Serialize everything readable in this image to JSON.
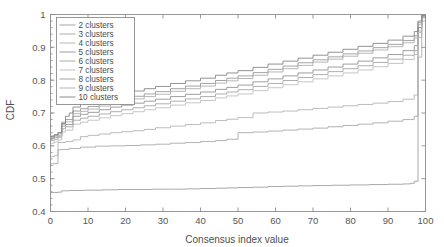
{
  "chart_data": {
    "type": "line",
    "title": "",
    "xlabel": "Consensus index value",
    "ylabel": "CDF",
    "xlim": [
      0,
      100
    ],
    "ylim": [
      0.4,
      1.0
    ],
    "grid": false,
    "legend_position": "upper-left",
    "xticks": [
      0,
      10,
      20,
      30,
      40,
      50,
      60,
      70,
      80,
      90,
      100
    ],
    "xtick_labels": [
      "0",
      "10",
      "20",
      "30",
      "40",
      "50",
      "60",
      "70",
      "80",
      "90",
      "100"
    ],
    "yticks": [
      0.4,
      0.5,
      0.6,
      0.7,
      0.8,
      0.9,
      1.0
    ],
    "ytick_labels": [
      "0.4",
      "0.5",
      "0.6",
      "0.7",
      "0.8",
      "0.9",
      "1"
    ],
    "series": [
      {
        "name": "2 clusters",
        "color": "#9a9a9a",
        "x": [
          0,
          1,
          2,
          3,
          5,
          9,
          14,
          18,
          22,
          27,
          32,
          36,
          40,
          44,
          47,
          50,
          54,
          58,
          62,
          66,
          70,
          75,
          80,
          85,
          90,
          94,
          96,
          97,
          98,
          99,
          100
        ],
        "y": [
          0.458,
          0.458,
          0.459,
          0.463,
          0.464,
          0.465,
          0.466,
          0.467,
          0.467,
          0.468,
          0.468,
          0.469,
          0.47,
          0.471,
          0.472,
          0.473,
          0.474,
          0.476,
          0.477,
          0.478,
          0.479,
          0.48,
          0.481,
          0.482,
          0.483,
          0.484,
          0.486,
          0.492,
          0.96,
          0.995,
          1.0
        ]
      },
      {
        "name": "3 clusters",
        "color": "#a5a5a5",
        "x": [
          0,
          1,
          2,
          3,
          5,
          8,
          12,
          16,
          20,
          24,
          28,
          32,
          36,
          40,
          44,
          47,
          50,
          54,
          58,
          62,
          66,
          70,
          74,
          78,
          82,
          86,
          90,
          94,
          97,
          98,
          99,
          100
        ],
        "y": [
          0.545,
          0.546,
          0.588,
          0.589,
          0.592,
          0.596,
          0.599,
          0.6,
          0.601,
          0.603,
          0.605,
          0.608,
          0.61,
          0.613,
          0.616,
          0.62,
          0.64,
          0.642,
          0.645,
          0.648,
          0.651,
          0.654,
          0.658,
          0.662,
          0.666,
          0.67,
          0.675,
          0.68,
          0.69,
          0.87,
          0.98,
          1.0
        ]
      },
      {
        "name": "4 clusters",
        "color": "#b0b0b0",
        "x": [
          0,
          1,
          2,
          4,
          6,
          8,
          10,
          13,
          16,
          19,
          22,
          25,
          28,
          32,
          36,
          40,
          44,
          47,
          50,
          54,
          58,
          62,
          66,
          70,
          74,
          78,
          82,
          86,
          90,
          94,
          97,
          98,
          99,
          100
        ],
        "y": [
          0.567,
          0.57,
          0.61,
          0.613,
          0.618,
          0.628,
          0.632,
          0.636,
          0.64,
          0.643,
          0.646,
          0.65,
          0.655,
          0.66,
          0.665,
          0.67,
          0.677,
          0.681,
          0.686,
          0.7,
          0.703,
          0.706,
          0.71,
          0.714,
          0.718,
          0.722,
          0.726,
          0.73,
          0.735,
          0.742,
          0.755,
          0.93,
          0.99,
          1.0
        ]
      },
      {
        "name": "5 clusters",
        "color": "#8e8e8e",
        "x": [
          0,
          1,
          2,
          3,
          4,
          6,
          8,
          10,
          13,
          16,
          19,
          22,
          25,
          28,
          32,
          36,
          40,
          44,
          47,
          50,
          54,
          58,
          62,
          66,
          70,
          74,
          78,
          82,
          86,
          90,
          94,
          97,
          98,
          99,
          100
        ],
        "y": [
          0.622,
          0.626,
          0.63,
          0.66,
          0.665,
          0.69,
          0.696,
          0.702,
          0.71,
          0.718,
          0.724,
          0.73,
          0.736,
          0.742,
          0.75,
          0.757,
          0.764,
          0.772,
          0.778,
          0.785,
          0.795,
          0.804,
          0.813,
          0.822,
          0.831,
          0.84,
          0.849,
          0.858,
          0.868,
          0.878,
          0.89,
          0.905,
          0.96,
          0.995,
          1.0
        ]
      },
      {
        "name": "6 clusters",
        "color": "#a0a0a0",
        "x": [
          0,
          1,
          2,
          3,
          4,
          6,
          8,
          10,
          13,
          16,
          19,
          22,
          25,
          28,
          32,
          36,
          40,
          44,
          47,
          50,
          54,
          58,
          62,
          66,
          70,
          74,
          78,
          82,
          86,
          90,
          94,
          97,
          98,
          99,
          100
        ],
        "y": [
          0.616,
          0.62,
          0.626,
          0.652,
          0.658,
          0.678,
          0.684,
          0.69,
          0.697,
          0.704,
          0.71,
          0.716,
          0.722,
          0.728,
          0.736,
          0.743,
          0.75,
          0.758,
          0.764,
          0.771,
          0.781,
          0.79,
          0.799,
          0.808,
          0.817,
          0.826,
          0.835,
          0.844,
          0.854,
          0.864,
          0.876,
          0.89,
          0.95,
          0.992,
          1.0
        ]
      },
      {
        "name": "7 clusters",
        "color": "#bcbcbc",
        "x": [
          0,
          1,
          2,
          3,
          4,
          6,
          8,
          10,
          13,
          16,
          19,
          22,
          25,
          28,
          32,
          36,
          40,
          44,
          47,
          50,
          54,
          58,
          62,
          66,
          70,
          74,
          78,
          82,
          86,
          90,
          94,
          97,
          98,
          99,
          100
        ],
        "y": [
          0.608,
          0.612,
          0.618,
          0.642,
          0.648,
          0.666,
          0.672,
          0.678,
          0.685,
          0.692,
          0.698,
          0.704,
          0.71,
          0.716,
          0.724,
          0.731,
          0.738,
          0.746,
          0.752,
          0.758,
          0.768,
          0.777,
          0.786,
          0.795,
          0.804,
          0.813,
          0.822,
          0.831,
          0.841,
          0.851,
          0.863,
          0.878,
          0.945,
          0.99,
          1.0
        ]
      },
      {
        "name": "8 clusters",
        "color": "#949494",
        "x": [
          0,
          1,
          2,
          3,
          4,
          6,
          8,
          10,
          13,
          16,
          19,
          22,
          25,
          28,
          32,
          36,
          40,
          44,
          47,
          50,
          54,
          58,
          62,
          66,
          70,
          74,
          78,
          82,
          86,
          90,
          94,
          97,
          98,
          99,
          100
        ],
        "y": [
          0.63,
          0.634,
          0.64,
          0.672,
          0.68,
          0.706,
          0.713,
          0.72,
          0.729,
          0.737,
          0.744,
          0.751,
          0.758,
          0.765,
          0.774,
          0.782,
          0.79,
          0.799,
          0.806,
          0.813,
          0.823,
          0.833,
          0.843,
          0.853,
          0.862,
          0.871,
          0.88,
          0.889,
          0.899,
          0.909,
          0.921,
          0.935,
          0.975,
          0.997,
          1.0
        ]
      },
      {
        "name": "9 clusters",
        "color": "#aaaaaa",
        "x": [
          0,
          1,
          2,
          3,
          4,
          6,
          8,
          10,
          13,
          16,
          19,
          22,
          25,
          28,
          32,
          36,
          40,
          44,
          47,
          50,
          54,
          58,
          62,
          66,
          70,
          74,
          78,
          82,
          86,
          90,
          94,
          97,
          98,
          99,
          100
        ],
        "y": [
          0.626,
          0.63,
          0.636,
          0.666,
          0.673,
          0.698,
          0.705,
          0.712,
          0.721,
          0.729,
          0.736,
          0.743,
          0.75,
          0.757,
          0.766,
          0.774,
          0.782,
          0.791,
          0.798,
          0.805,
          0.815,
          0.825,
          0.835,
          0.845,
          0.855,
          0.864,
          0.873,
          0.882,
          0.892,
          0.902,
          0.914,
          0.928,
          0.97,
          0.996,
          1.0
        ]
      },
      {
        "name": "10 clusters",
        "color": "#7f7f7f",
        "x": [
          0,
          1,
          2,
          3,
          4,
          5,
          6,
          8,
          10,
          13,
          16,
          19,
          22,
          25,
          28,
          32,
          36,
          40,
          44,
          47,
          50,
          54,
          58,
          62,
          66,
          70,
          74,
          78,
          82,
          86,
          90,
          94,
          97,
          98,
          99,
          100
        ],
        "y": [
          0.628,
          0.633,
          0.64,
          0.668,
          0.69,
          0.7,
          0.718,
          0.728,
          0.736,
          0.745,
          0.753,
          0.76,
          0.767,
          0.774,
          0.781,
          0.79,
          0.798,
          0.806,
          0.815,
          0.822,
          0.829,
          0.839,
          0.849,
          0.858,
          0.867,
          0.876,
          0.885,
          0.894,
          0.903,
          0.912,
          0.922,
          0.934,
          0.948,
          0.98,
          0.998,
          1.0
        ]
      }
    ],
    "legend_entries": [
      "2  clusters",
      "3  clusters",
      "4  clusters",
      "5  clusters",
      "6  clusters",
      "7  clusters",
      "8  clusters",
      "9  clusters",
      "10  clusters"
    ]
  },
  "axes": {
    "frame_color": "#8d8d8d",
    "background": "#ffffff"
  }
}
